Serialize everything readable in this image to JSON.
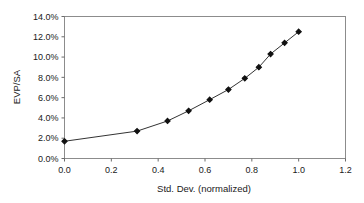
{
  "chart_data": {
    "type": "line",
    "title": "",
    "subtitle": "",
    "xlabel": "Std. Dev. (normalized)",
    "ylabel": "EVP/SA",
    "xlim": [
      0.0,
      1.2
    ],
    "ylim": [
      0.0,
      14.0
    ],
    "xticks": [
      "0.0",
      "0.2",
      "0.4",
      "0.6",
      "0.8",
      "1.0",
      "1.2"
    ],
    "xtick_values": [
      0.0,
      0.2,
      0.4,
      0.6,
      0.8,
      1.0,
      1.2
    ],
    "yticks": [
      "0.0%",
      "2.0%",
      "4.0%",
      "6.0%",
      "8.0%",
      "10.0%",
      "12.0%",
      "14.0%"
    ],
    "ytick_values": [
      0.0,
      2.0,
      4.0,
      6.0,
      8.0,
      10.0,
      12.0,
      14.0
    ],
    "grid": false,
    "legend": false,
    "legend_position": "none",
    "marker": "diamond",
    "line_color": "#333333",
    "marker_color": "#111111",
    "frame_color": "#8c8c8c",
    "background": "#ffffff",
    "x": [
      0.0,
      0.31,
      0.44,
      0.53,
      0.62,
      0.7,
      0.77,
      0.83,
      0.88,
      0.94,
      1.0
    ],
    "y": [
      1.7,
      2.7,
      3.7,
      4.7,
      5.8,
      6.8,
      7.9,
      9.0,
      10.3,
      11.4,
      12.5
    ],
    "series": [
      {
        "name": "EVP/SA",
        "points": [
          {
            "x": 0.0,
            "y": 1.7
          },
          {
            "x": 0.31,
            "y": 2.7
          },
          {
            "x": 0.44,
            "y": 3.7
          },
          {
            "x": 0.53,
            "y": 4.7
          },
          {
            "x": 0.62,
            "y": 5.8
          },
          {
            "x": 0.7,
            "y": 6.8
          },
          {
            "x": 0.77,
            "y": 7.9
          },
          {
            "x": 0.83,
            "y": 9.0
          },
          {
            "x": 0.88,
            "y": 10.3
          },
          {
            "x": 0.94,
            "y": 11.4
          },
          {
            "x": 1.0,
            "y": 12.5
          }
        ]
      }
    ]
  }
}
